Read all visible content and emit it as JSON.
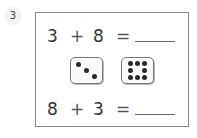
{
  "question": {
    "number": "3"
  },
  "equations": [
    {
      "left": "3",
      "operator": "+",
      "right": "8",
      "equals": "=",
      "answer": ""
    },
    {
      "left": "8",
      "operator": "+",
      "right": "3",
      "equals": "=",
      "answer": ""
    }
  ],
  "dice": [
    {
      "value": 3,
      "label": "die showing 3"
    },
    {
      "value": 8,
      "label": "die showing 8"
    }
  ]
}
